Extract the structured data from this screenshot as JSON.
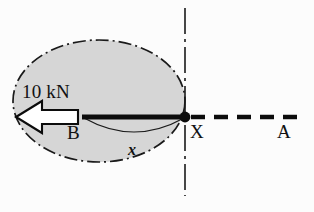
{
  "figure": {
    "title_caption": "",
    "background_color": "#fcfcfc",
    "body_fill_color": "#d6d6d6",
    "line_color": "#111111"
  },
  "labels": {
    "load": "10 kN",
    "point_b": "B",
    "point_x": "X",
    "point_a": "A",
    "dimension_x": "x"
  },
  "geometry": {
    "ellipse": {
      "cx": 99,
      "cy": 101,
      "rx": 86,
      "ry": 61,
      "style": "dash-dot"
    },
    "beam": {
      "x1": 82,
      "x2": 185,
      "y": 117,
      "thickness": 5
    },
    "node_dot": {
      "cx": 185,
      "cy": 117,
      "r": 5
    },
    "centerline_vertical": {
      "x": 185,
      "y1": 8,
      "y2": 196,
      "style": "dash-dot"
    },
    "dashed_axis": {
      "x1": 191,
      "x2": 301,
      "y": 117,
      "style": "dashed"
    },
    "dimension_arc": {
      "x1": 84,
      "x2": 184,
      "y": 118,
      "sag": 16
    },
    "force_arrow": {
      "tip_x": 16,
      "tail_x": 78,
      "y": 117,
      "direction": "left",
      "fill": "#ffffff"
    }
  }
}
